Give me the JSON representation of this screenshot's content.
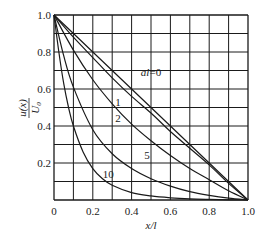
{
  "chart_data": {
    "type": "line",
    "title": "",
    "xlabel": "x/l",
    "ylabel": "u(x)/U0",
    "xlim": [
      0,
      1.0
    ],
    "ylim": [
      0,
      1.0
    ],
    "grid": true,
    "grid_step": 0.1,
    "x_ticks": [
      "0",
      "0.2",
      "0.4",
      "0.6",
      "0.8",
      "1.0"
    ],
    "y_ticks": [
      "0.2",
      "0.4",
      "0.6",
      "0.8",
      "1.0"
    ],
    "legend": "inline curve labels",
    "series": [
      {
        "name": "al=0",
        "label": "al=0",
        "x": [
          0,
          0.2,
          0.4,
          0.6,
          0.8,
          1.0
        ],
        "y": [
          1.0,
          0.8,
          0.6,
          0.4,
          0.2,
          0.0
        ]
      },
      {
        "name": "1",
        "label": "1",
        "x": [
          0,
          0.1,
          0.2,
          0.3,
          0.4,
          0.5,
          0.6,
          0.7,
          0.8,
          0.9,
          1.0
        ],
        "y": [
          1.0,
          0.88,
          0.77,
          0.66,
          0.56,
          0.47,
          0.37,
          0.28,
          0.19,
          0.09,
          0.0
        ]
      },
      {
        "name": "2",
        "label": "2",
        "x": [
          0,
          0.1,
          0.2,
          0.3,
          0.4,
          0.5,
          0.6,
          0.7,
          0.8,
          0.9,
          1.0
        ],
        "y": [
          1.0,
          0.81,
          0.65,
          0.52,
          0.41,
          0.32,
          0.24,
          0.17,
          0.11,
          0.05,
          0.0
        ]
      },
      {
        "name": "5",
        "label": "5",
        "x": [
          0,
          0.05,
          0.1,
          0.2,
          0.3,
          0.4,
          0.5,
          0.6,
          0.7,
          0.8,
          0.9,
          1.0
        ],
        "y": [
          1.0,
          0.78,
          0.61,
          0.38,
          0.25,
          0.17,
          0.115,
          0.075,
          0.045,
          0.025,
          0.01,
          0.0
        ]
      },
      {
        "name": "10",
        "label": "10",
        "x": [
          0,
          0.025,
          0.05,
          0.075,
          0.1,
          0.15,
          0.2,
          0.25,
          0.3,
          0.4,
          0.5,
          0.6,
          0.7,
          0.8,
          0.9,
          1.0
        ],
        "y": [
          1.0,
          0.8,
          0.63,
          0.5,
          0.4,
          0.26,
          0.17,
          0.115,
          0.08,
          0.04,
          0.022,
          0.012,
          0.006,
          0.003,
          0.001,
          0.0
        ]
      }
    ],
    "labels": [
      {
        "text": "al=0",
        "x": 0.5,
        "y": 0.67
      },
      {
        "text": "1",
        "x": 0.33,
        "y": 0.51
      },
      {
        "text": "2",
        "x": 0.33,
        "y": 0.42
      },
      {
        "text": "5",
        "x": 0.48,
        "y": 0.22
      },
      {
        "text": "10",
        "x": 0.28,
        "y": 0.12
      }
    ]
  }
}
